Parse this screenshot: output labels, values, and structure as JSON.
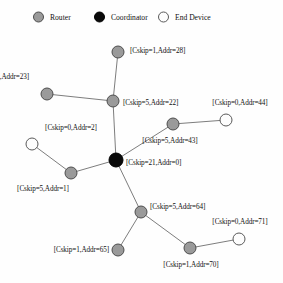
{
  "legend": {
    "items": [
      {
        "label": "Router",
        "kind": "router",
        "x": 33
      },
      {
        "label": "Coordinator",
        "kind": "coordinator",
        "x": 94
      },
      {
        "label": "End Device",
        "kind": "enddevice",
        "x": 158
      }
    ]
  },
  "chart_data": {
    "type": "diagram",
    "title": "",
    "subtype": "network-tree-topology",
    "node_kinds": [
      "router",
      "coordinator",
      "enddevice"
    ],
    "nodes": [
      {
        "id": "n0",
        "label": "[Cskip=21,Addr=0]",
        "cskip": 21,
        "addr": 0,
        "kind": "coordinator",
        "x": 116,
        "y": 160,
        "r": 7.5,
        "label_x": 126,
        "label_y": 163,
        "label_align": "right"
      },
      {
        "id": "n22",
        "label": "[Cskip=5,Addr=22]",
        "cskip": 5,
        "addr": 22,
        "kind": "router",
        "x": 113,
        "y": 101,
        "r": 6.5,
        "label_x": 123,
        "label_y": 103,
        "label_align": "right"
      },
      {
        "id": "n28",
        "label": "[Cskip=1,Addr=28]",
        "cskip": 1,
        "addr": 28,
        "kind": "router",
        "x": 118,
        "y": 52,
        "r": 6.5,
        "label_x": 130,
        "label_y": 51,
        "label_align": "right"
      },
      {
        "id": "n23",
        "label": "[Cskip=1,Addr=23]",
        "cskip": 1,
        "addr": 23,
        "kind": "router",
        "x": 47,
        "y": 94,
        "r": 6.5,
        "label_x": 29,
        "label_y": 77,
        "label_align": "left"
      },
      {
        "id": "n43",
        "label": "[Cskip=5,Addr=43]",
        "cskip": 5,
        "addr": 43,
        "kind": "router",
        "x": 173,
        "y": 124,
        "r": 6.5,
        "label_x": 170,
        "label_y": 141,
        "label_align": "mid"
      },
      {
        "id": "n44",
        "label": "[Cskip=0,Addr=44]",
        "cskip": 0,
        "addr": 44,
        "kind": "enddevice",
        "x": 226,
        "y": 120,
        "r": 6.5,
        "label_x": 240,
        "label_y": 103,
        "label_align": "mid"
      },
      {
        "id": "n2",
        "label": "[Cskip=0,Addr=2]",
        "cskip": 0,
        "addr": 2,
        "kind": "enddevice",
        "x": 32,
        "y": 144,
        "r": 6.5,
        "label_x": 71,
        "label_y": 128,
        "label_align": "mid"
      },
      {
        "id": "n1",
        "label": "[Cskip=5,Addr=1]",
        "cskip": 5,
        "addr": 1,
        "kind": "router",
        "x": 71,
        "y": 173,
        "r": 6.5,
        "label_x": 43,
        "label_y": 189,
        "label_align": "mid"
      },
      {
        "id": "n64",
        "label": "[Cskip=5,Addr=64]",
        "cskip": 5,
        "addr": 64,
        "kind": "router",
        "x": 141,
        "y": 212,
        "r": 6.5,
        "label_x": 150,
        "label_y": 207,
        "label_align": "right"
      },
      {
        "id": "n65",
        "label": "[Cskip=1,Addr=65]",
        "cskip": 1,
        "addr": 65,
        "kind": "router",
        "x": 118,
        "y": 250,
        "r": 6.5,
        "label_x": 109,
        "label_y": 250,
        "label_align": "left"
      },
      {
        "id": "n70",
        "label": "[Cskip=1,Addr=70]",
        "cskip": 1,
        "addr": 70,
        "kind": "router",
        "x": 190,
        "y": 248,
        "r": 6.5,
        "label_x": 191,
        "label_y": 265,
        "label_align": "mid"
      },
      {
        "id": "n71",
        "label": "[Cskip=0,Addr=71]",
        "cskip": 0,
        "addr": 71,
        "kind": "enddevice",
        "x": 239,
        "y": 239,
        "r": 6.5,
        "label_x": 240,
        "label_y": 222,
        "label_align": "mid"
      }
    ],
    "edges": [
      {
        "from": "n0",
        "to": "n22"
      },
      {
        "from": "n22",
        "to": "n28"
      },
      {
        "from": "n22",
        "to": "n23"
      },
      {
        "from": "n0",
        "to": "n43"
      },
      {
        "from": "n43",
        "to": "n44"
      },
      {
        "from": "n0",
        "to": "n1"
      },
      {
        "from": "n1",
        "to": "n2"
      },
      {
        "from": "n0",
        "to": "n64"
      },
      {
        "from": "n64",
        "to": "n65"
      },
      {
        "from": "n64",
        "to": "n70"
      },
      {
        "from": "n70",
        "to": "n71"
      }
    ],
    "colors": {
      "router": "#9a9a9a",
      "coordinator": "#0a0a0a",
      "enddevice": "#fdfdfd",
      "edge": "#6e6e6e",
      "stroke": "#4d4d4d",
      "text": "#111111"
    }
  }
}
